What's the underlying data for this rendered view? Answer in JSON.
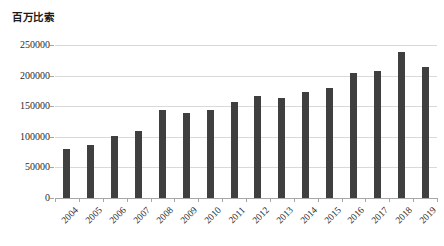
{
  "chart_data": {
    "type": "bar",
    "title": "百万比索",
    "xlabel": "",
    "ylabel": "百万比索",
    "ylim": [
      0,
      250000
    ],
    "grid": true,
    "legend": "none",
    "bar_color": "#3f3f3f",
    "gridline_color": "#d9d9d9",
    "axis_color": "#a6a6a6",
    "categories": [
      "2004",
      "2005",
      "2006",
      "2007",
      "2008",
      "2009",
      "2010",
      "2011",
      "2012",
      "2013",
      "2014",
      "2015",
      "2016",
      "2017",
      "2018",
      "2019"
    ],
    "values": [
      80000,
      86000,
      102000,
      110000,
      143000,
      139000,
      143000,
      157000,
      167000,
      164000,
      174000,
      179000,
      205000,
      207000,
      239000,
      214000
    ],
    "y_ticks": [
      0,
      50000,
      100000,
      150000,
      200000,
      250000
    ],
    "y_tick_labels": [
      "0",
      "50000",
      "100000",
      "150000",
      "200000",
      "250000"
    ]
  }
}
